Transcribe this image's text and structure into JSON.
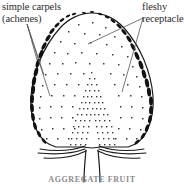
{
  "figure": {
    "kind": "botanical-line-drawing",
    "caption": "AGGREGATE FRUIT",
    "background_color": "#ffffff",
    "ink_color": "#1a1a1a",
    "stipple_color": "#3a3a3a",
    "leader_color": "#555555",
    "caption_color": "#8a8a8a"
  },
  "labels": {
    "carpels": {
      "line1": "simple carpels",
      "line2": "(achenes)"
    },
    "receptacle": {
      "line1": "fleshy",
      "line2": "receptacle"
    }
  }
}
